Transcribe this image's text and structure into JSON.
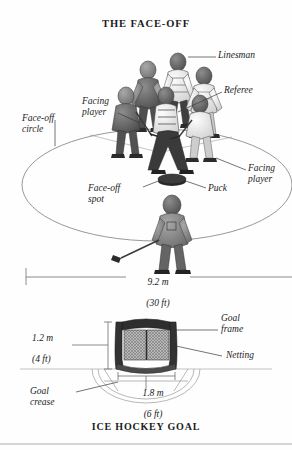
{
  "plate": {
    "top_title": "THE FACE-OFF",
    "bottom_title": "ICE HOCKEY GOAL"
  },
  "faceoff_diagram": {
    "labels": {
      "linesman": "Linesman",
      "referee": "Referee",
      "facing_player_left": "Facing\nplayer",
      "facing_player_right": "Facing\nplayer",
      "faceoff_circle": "Face-off\ncircle",
      "faceoff_spot": "Face-off\nspot",
      "puck": "Puck"
    },
    "dimension": {
      "metric": "9.2 m",
      "imperial": "(30 ft)"
    }
  },
  "goal_diagram": {
    "labels": {
      "goal_frame": "Goal\nframe",
      "netting": "Netting",
      "goal_crease": "Goal\ncrease"
    },
    "height_dimension": {
      "metric": "1.2 m",
      "imperial": "(4 ft)"
    },
    "width_dimension": {
      "metric": "1.8 m",
      "imperial": "(6 ft)"
    }
  },
  "colors": {
    "page_background": "#fefefe",
    "ink": "#1c1c1c",
    "line": "#7d7d7d",
    "frame_dark": "#2b2b2b",
    "jersey_dark": "#5a5a5a",
    "jersey_light": "#e8e8e8"
  }
}
